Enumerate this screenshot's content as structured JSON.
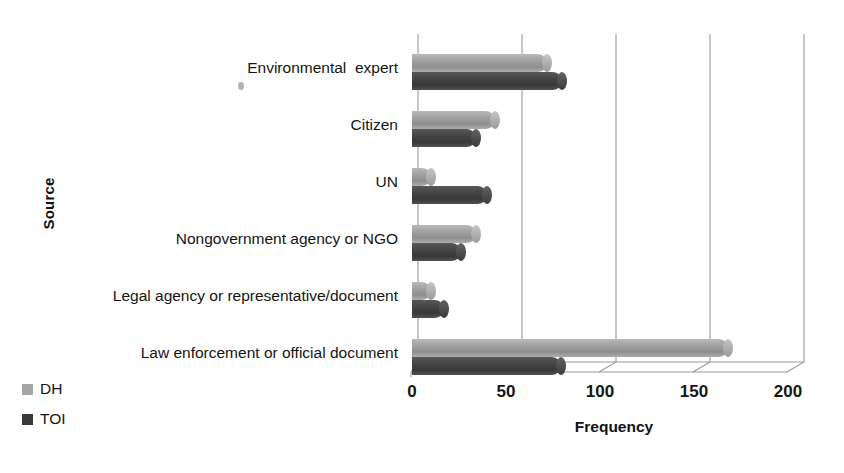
{
  "chart_data": {
    "type": "bar",
    "orientation": "horizontal",
    "title": "",
    "xlabel": "Frequency",
    "ylabel": "Source",
    "xlim": [
      0,
      200
    ],
    "xticks": [
      0,
      50,
      100,
      150,
      200
    ],
    "grid": true,
    "legend_position": "bottom-left",
    "categories": [
      "Environmental  expert",
      "Citizen",
      "UN",
      "Nongovernment agency or NGO",
      "Legal agency or representative/document",
      "Law enforcement or official document"
    ],
    "series": [
      {
        "name": "DH",
        "color": "#a6a6a6",
        "values": [
          72,
          44,
          10,
          34,
          10,
          168
        ]
      },
      {
        "name": "TOI",
        "color": "#3a3a3a",
        "values": [
          80,
          34,
          40,
          26,
          17,
          79
        ]
      }
    ]
  },
  "axis": {
    "y_title": "Source",
    "x_title": "Frequency",
    "x_tick_labels": [
      "0",
      "50",
      "100",
      "150",
      "200"
    ]
  },
  "legend": {
    "items": [
      {
        "label": "DH",
        "color": "#a6a6a6"
      },
      {
        "label": "TOI",
        "color": "#3a3a3a"
      }
    ]
  }
}
